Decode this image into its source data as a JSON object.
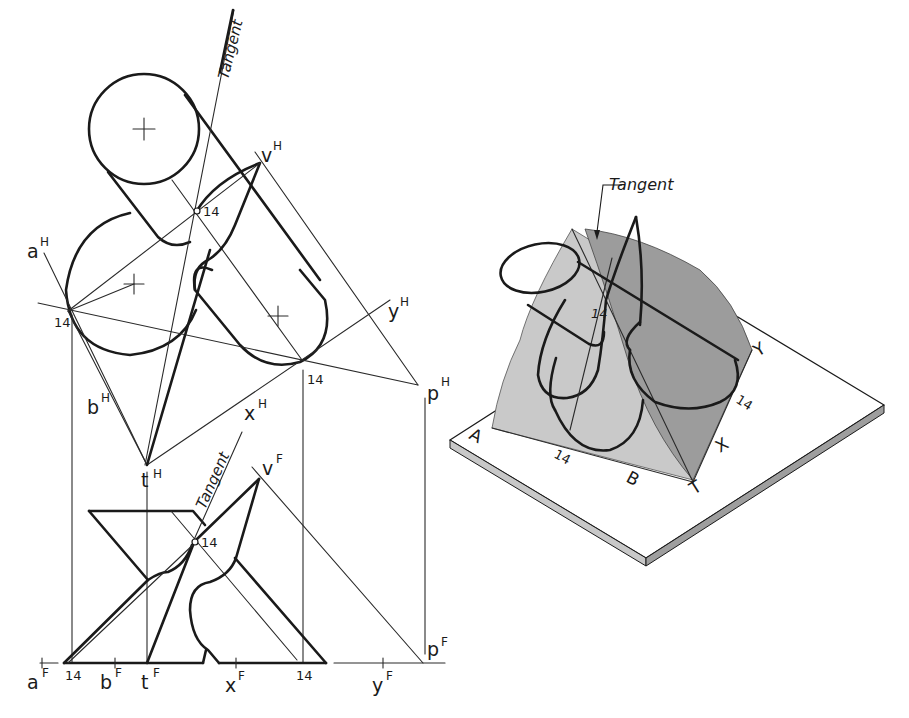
{
  "figure": {
    "colors": {
      "ink": "#1a1a1a",
      "shade_light": "#c9c9c9",
      "shade_dark": "#9c9c9c",
      "plate_edge": "#b8b8b8",
      "background": "#ffffff"
    },
    "top_view": {
      "tangent_label": "Tangent",
      "point_labels": {
        "a": "a",
        "a_sup": "H",
        "b": "b",
        "b_sup": "H",
        "t": "t",
        "t_sup": "H",
        "x": "x",
        "x_sup": "H",
        "y": "y",
        "y_sup": "H",
        "v": "v",
        "v_sup": "H",
        "p": "p",
        "p_sup": "H"
      },
      "tangent_point_labels": [
        "14",
        "14",
        "14"
      ]
    },
    "front_view": {
      "tangent_label": "Tangent",
      "point_labels": {
        "a": "a",
        "a_sup": "F",
        "b": "b",
        "b_sup": "F",
        "t": "t",
        "t_sup": "F",
        "x": "x",
        "x_sup": "F",
        "y": "y",
        "y_sup": "F",
        "v": "v",
        "v_sup": "F",
        "p": "p",
        "p_sup": "F"
      },
      "tangent_point_labels": [
        "14",
        "14",
        "14"
      ]
    },
    "pictorial_view": {
      "tangent_label": "Tangent",
      "point_labels": [
        "A",
        "B",
        "T",
        "X",
        "Y"
      ],
      "tangent_point_labels": [
        "14",
        "14",
        "14"
      ]
    }
  }
}
